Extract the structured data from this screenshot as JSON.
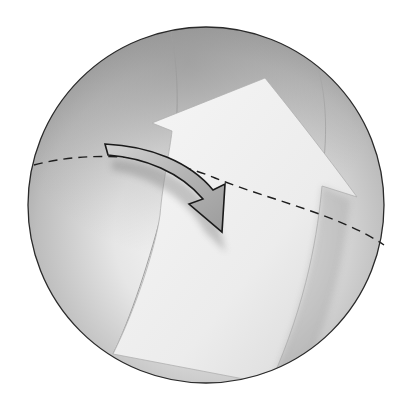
{
  "diagram": {
    "type": "sphere-illustration",
    "colors": {
      "background": "#ffffff",
      "sphere_outline": "#2a2a2a",
      "sphere_shade_dark": "#8c8c8c",
      "sphere_shade_mid": "#c4c4c4",
      "sphere_highlight": "#f7f7f7",
      "equator_dash": "#1e1e1e",
      "large_arrow_fill": "#f2f2f2",
      "small_arrow_fill": "#b8b8b8",
      "small_arrow_outline": "#1a1a1a"
    },
    "elements": [
      {
        "name": "sphere",
        "shape": "circle",
        "center": [
          206,
          205
        ],
        "radius": 178
      },
      {
        "name": "equator",
        "style": "dashed",
        "label": ""
      },
      {
        "name": "large-arrow",
        "direction": "up-right",
        "label": ""
      },
      {
        "name": "small-curved-arrow",
        "direction": "down-right",
        "label": ""
      }
    ]
  }
}
